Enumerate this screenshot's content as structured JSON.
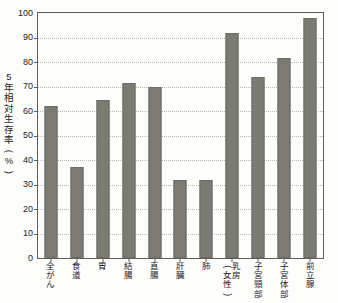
{
  "chart_data": {
    "type": "bar",
    "title": "",
    "xlabel": "",
    "ylabel": "5年相対生存率(%)",
    "ylim": [
      0,
      100
    ],
    "ytick_values": [
      100,
      90,
      80,
      70,
      60,
      50,
      40,
      30,
      20,
      10,
      0
    ],
    "grid": true,
    "legend": null,
    "bar_color": "#7b7b74",
    "axis_color": "#5e5e57",
    "grid_color": "#b9b7ae",
    "categories": [
      "全がん",
      "食道",
      "胃",
      "結腸",
      "直腸",
      "肝臓",
      "肺",
      "乳房(女性)",
      "子宮頸部",
      "子宮体部",
      "前立腺"
    ],
    "values": [
      62,
      37,
      64.5,
      71.5,
      70,
      32,
      32,
      92,
      74,
      81.5,
      98
    ]
  },
  "ylabel_chars": [
    "5",
    "年",
    "相",
    "対",
    "生",
    "存",
    "率",
    "(",
    "%",
    ")"
  ],
  "xlabels": [
    {
      "name": "all-cancers",
      "lines": [
        "全",
        "が",
        "ん"
      ],
      "rotated": [
        false,
        false,
        false
      ],
      "columns": null
    },
    {
      "name": "esophagus",
      "lines": [
        "食",
        "道"
      ],
      "rotated": [
        false,
        false
      ],
      "columns": null
    },
    {
      "name": "stomach",
      "lines": [
        "胃"
      ],
      "rotated": [
        false
      ],
      "columns": null
    },
    {
      "name": "colon",
      "lines": [
        "結",
        "腸"
      ],
      "rotated": [
        false,
        false
      ],
      "columns": null
    },
    {
      "name": "rectum",
      "lines": [
        "直",
        "腸"
      ],
      "rotated": [
        false,
        false
      ],
      "columns": null
    },
    {
      "name": "liver",
      "lines": [
        "肝",
        "臓"
      ],
      "rotated": [
        false,
        false
      ],
      "columns": null
    },
    {
      "name": "lung",
      "lines": [
        "肺"
      ],
      "rotated": [
        false
      ],
      "columns": null
    },
    {
      "name": "breast-female",
      "lines": null,
      "rotated": null,
      "columns": [
        [
          "(",
          "女",
          "性",
          ")"
        ],
        [
          "乳",
          "房"
        ]
      ]
    },
    {
      "name": "cervix-uteri",
      "lines": [
        "子",
        "宮",
        "頸",
        "部"
      ],
      "rotated": [
        false,
        false,
        false,
        false
      ],
      "columns": null
    },
    {
      "name": "corpus-uteri",
      "lines": [
        "子",
        "宮",
        "体",
        "部"
      ],
      "rotated": [
        false,
        false,
        false,
        false
      ],
      "columns": null
    },
    {
      "name": "prostate",
      "lines": [
        "前",
        "立",
        "腺"
      ],
      "rotated": [
        false,
        false,
        false
      ],
      "columns": null
    }
  ],
  "top_caption": ""
}
